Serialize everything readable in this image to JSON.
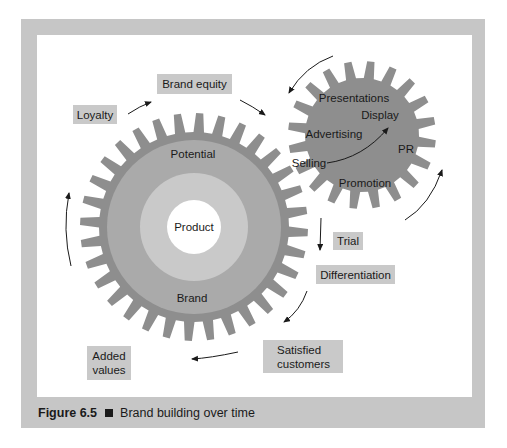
{
  "colors": {
    "frame": "#c6c6c6",
    "gear": "#8e8e8e",
    "ring_mid": "#aaaaaa",
    "ring_light": "#c9c9c9",
    "center": "#ffffff",
    "label_box": "#c9c9c9",
    "text": "#1a1a1a"
  },
  "big_gear": {
    "cx": 194,
    "cy": 227,
    "outer_r": 114,
    "root_r": 95,
    "teeth": 32,
    "rings": [
      {
        "name": "potential",
        "r": 87
      },
      {
        "name": "brand",
        "r": 54
      },
      {
        "name": "product",
        "r": 27
      }
    ],
    "labels": {
      "potential": "Potential",
      "product": "Product",
      "brand": "Brand"
    }
  },
  "small_gear": {
    "cx": 362,
    "cy": 135,
    "outer_r": 74,
    "root_r": 57,
    "teeth": 20,
    "labels": {
      "presentations": "Presentations",
      "display": "Display",
      "advertising": "Advertising",
      "pr": "PR",
      "selling": "Selling",
      "promotion": "Promotion"
    }
  },
  "stages": {
    "brand_equity": "Brand equity",
    "loyalty": "Loyalty",
    "trial": "Trial",
    "differentiation": "Differentiation",
    "satisfied_customers": "Satisfied customers",
    "added_values": "Added values"
  },
  "caption": {
    "figure": "Figure 6.5",
    "title": "Brand building over time"
  }
}
